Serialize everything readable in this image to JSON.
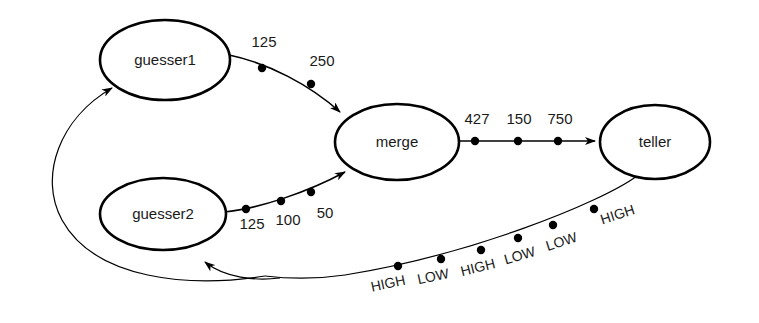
{
  "diagram": {
    "background_color": "#ffffff",
    "stroke_color": "#000000",
    "text_color": "#1a1a1a",
    "nodes": [
      {
        "id": "guesser1",
        "label": "guesser1",
        "cx": 165,
        "cy": 60,
        "rx": 65,
        "ry": 40
      },
      {
        "id": "guesser2",
        "label": "guesser2",
        "cx": 163,
        "cy": 214,
        "rx": 63,
        "ry": 36
      },
      {
        "id": "merge",
        "label": "merge",
        "cx": 397,
        "cy": 142,
        "rx": 62,
        "ry": 38
      },
      {
        "id": "teller",
        "label": "teller",
        "cx": 655,
        "cy": 142,
        "rx": 55,
        "ry": 37
      }
    ],
    "edges": [
      {
        "id": "guesser1-to-merge",
        "from": "guesser1",
        "to": "merge",
        "tokens": [
          "125",
          "250"
        ],
        "token_positions": [
          {
            "x": 262,
            "y": 68
          },
          {
            "x": 311,
            "y": 84
          }
        ],
        "label_positions": [
          {
            "x": 264,
            "y": 47
          },
          {
            "x": 320,
            "y": 66
          }
        ]
      },
      {
        "id": "guesser2-to-merge",
        "from": "guesser2",
        "to": "merge",
        "tokens": [
          "125",
          "100",
          "50"
        ],
        "token_positions": [
          {
            "x": 246,
            "y": 209
          },
          {
            "x": 281,
            "y": 201
          },
          {
            "x": 311,
            "y": 192
          }
        ],
        "label_positions": [
          {
            "x": 252,
            "y": 228
          },
          {
            "x": 288,
            "y": 224
          },
          {
            "x": 325,
            "y": 217
          }
        ]
      },
      {
        "id": "merge-to-teller",
        "from": "merge",
        "to": "teller",
        "tokens": [
          "427",
          "150",
          "750"
        ],
        "token_positions": [
          {
            "x": 475,
            "y": 141
          },
          {
            "x": 518,
            "y": 141
          },
          {
            "x": 558,
            "y": 141
          }
        ],
        "label_positions": [
          {
            "x": 477,
            "y": 124
          },
          {
            "x": 519,
            "y": 124
          },
          {
            "x": 560,
            "y": 124
          }
        ]
      },
      {
        "id": "teller-feedback",
        "from": "teller",
        "to": "guesser1-and-guesser2",
        "tokens": [
          "HIGH",
          "LOW",
          "HIGH",
          "LOW",
          "LOW",
          "HIGH"
        ],
        "token_positions": [
          {
            "x": 398,
            "y": 266
          },
          {
            "x": 441,
            "y": 259
          },
          {
            "x": 481,
            "y": 250
          },
          {
            "x": 518,
            "y": 238
          },
          {
            "x": 553,
            "y": 225
          },
          {
            "x": 594,
            "y": 209
          }
        ],
        "label_positions": [
          {
            "x": 389,
            "y": 288
          },
          {
            "x": 432,
            "y": 280
          },
          {
            "x": 477,
            "y": 271
          },
          {
            "x": 519,
            "y": 259
          },
          {
            "x": 561,
            "y": 245
          },
          {
            "x": 617,
            "y": 218
          }
        ],
        "label_rotations": [
          -12,
          -12,
          -14,
          -16,
          -18,
          -18
        ]
      }
    ]
  }
}
